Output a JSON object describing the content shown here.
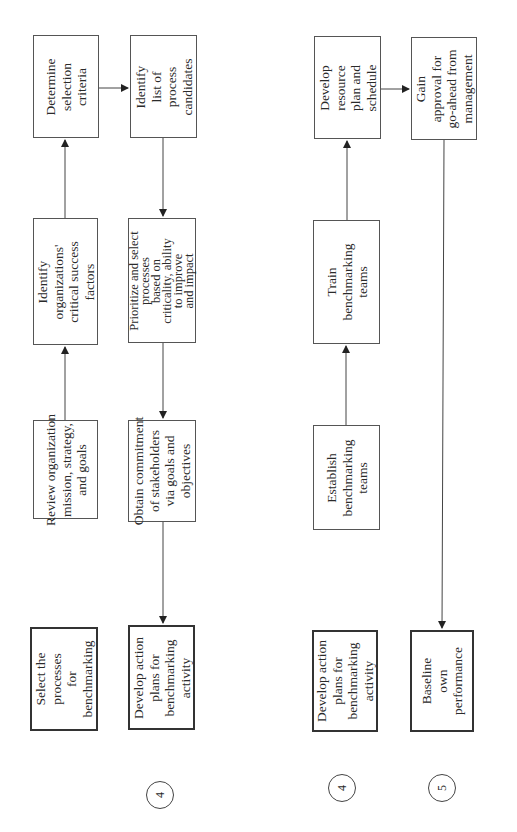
{
  "diagram": {
    "top": {
      "steps": [
        {
          "number": "3",
          "label_lines": [
            "Select the",
            "processes",
            "for",
            "benchmarking"
          ]
        },
        {
          "number": "4",
          "label_lines": [
            "Develop action",
            "plans for",
            "benchmarking",
            "activity"
          ]
        }
      ],
      "row3": [
        {
          "label_lines": [
            "Review organization",
            "mission, strategy,",
            "and goals"
          ]
        },
        {
          "label_lines": [
            "Identify",
            "organizations'",
            "critical success",
            "factors"
          ]
        },
        {
          "label_lines": [
            "Determine",
            "selection",
            "criteria"
          ]
        }
      ],
      "row4": [
        {
          "label_lines": [
            "Identify",
            "list of",
            "process",
            "candidates"
          ]
        },
        {
          "label_lines": [
            "Prioritize and select",
            "processes",
            "based on",
            "criticality, ability",
            "to improve",
            "and impact"
          ]
        },
        {
          "label_lines": [
            "Obtain commitment",
            "of stakeholders",
            "via goals and",
            "objectives"
          ]
        }
      ]
    },
    "bottom": {
      "steps": [
        {
          "number": "4",
          "label_lines": [
            "Develop action",
            "plans for",
            "benchmarking",
            "activity"
          ]
        },
        {
          "number": "5",
          "label_lines": [
            "Baseline",
            "own",
            "performance"
          ]
        }
      ],
      "row4": [
        {
          "label_lines": [
            "Establish",
            "benchmarking",
            "teams"
          ]
        },
        {
          "label_lines": [
            "Train",
            "benchmarking",
            "teams"
          ]
        },
        {
          "label_lines": [
            "Develop",
            "resource",
            "plan and",
            "schedule"
          ]
        }
      ],
      "row5": [
        {
          "label_lines": [
            "Gain",
            "approval for",
            "go-ahead from",
            "management"
          ]
        }
      ]
    }
  }
}
